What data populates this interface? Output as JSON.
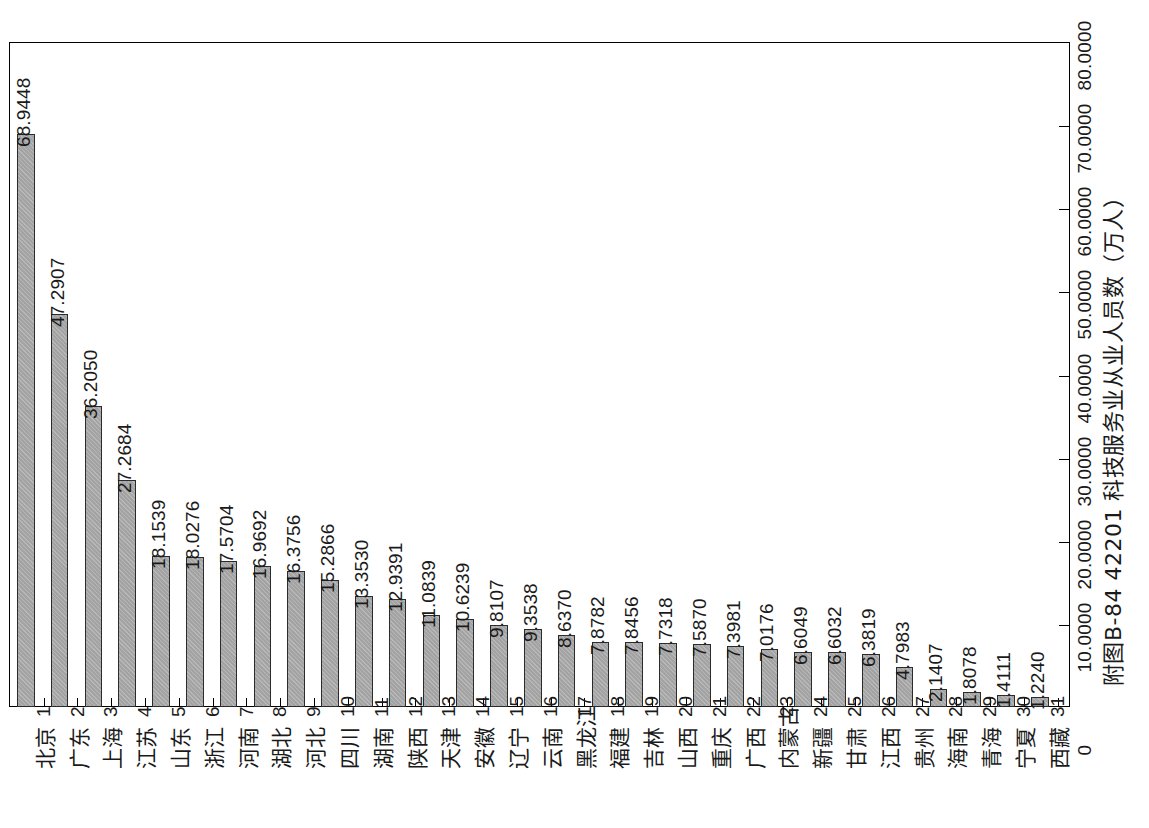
{
  "caption": "附图B-84  42201 科技服务业从业人员数（万人）",
  "chart_data": {
    "type": "bar",
    "title": "附图B-84  42201 科技服务业从业人员数（万人）",
    "xlabel": "",
    "ylabel": "万人",
    "orientation": "vertical-rotated-90ccw",
    "ylim": [
      0,
      80
    ],
    "grid": false,
    "legend": null,
    "value_tick_labels": [
      "0",
      "10.0000",
      "20.0000",
      "30.0000",
      "40.0000",
      "50.0000",
      "60.0000",
      "70.0000",
      "80.0000"
    ],
    "value_ticks": [
      0,
      10,
      20,
      30,
      40,
      50,
      60,
      70,
      80
    ],
    "ranks": [
      1,
      2,
      3,
      4,
      5,
      6,
      7,
      8,
      9,
      10,
      11,
      12,
      13,
      14,
      15,
      16,
      17,
      18,
      19,
      20,
      21,
      22,
      23,
      24,
      25,
      26,
      27,
      28,
      29,
      30,
      31
    ],
    "categories": [
      "北京",
      "广东",
      "上海",
      "江苏",
      "山东",
      "浙江",
      "河南",
      "湖北",
      "河北",
      "四川",
      "湖南",
      "陕西",
      "天津",
      "安徽",
      "辽宁",
      "云南",
      "黑龙江",
      "福建",
      "吉林",
      "山西",
      "重庆",
      "广西",
      "内蒙古",
      "新疆",
      "甘肃",
      "江西",
      "贵州",
      "海南",
      "青海",
      "宁夏",
      "西藏"
    ],
    "values": [
      68.9448,
      47.2907,
      36.205,
      27.2684,
      18.1539,
      18.0276,
      17.5704,
      16.9692,
      16.3756,
      15.2866,
      13.353,
      12.9391,
      11.0839,
      10.6239,
      9.8107,
      9.3538,
      8.637,
      7.8782,
      7.8456,
      7.7318,
      7.587,
      7.3981,
      7.0176,
      6.6049,
      6.6032,
      6.3819,
      4.7983,
      2.1407,
      1.8078,
      1.4111,
      1.224
    ],
    "value_labels": [
      "68.9448",
      "47.2907",
      "36.2050",
      "27.2684",
      "18.1539",
      "18.0276",
      "17.5704",
      "16.9692",
      "16.3756",
      "15.2866",
      "13.3530",
      "12.9391",
      "11.0839",
      "10.6239",
      "9.8107",
      "9.3538",
      "8.6370",
      "7.8782",
      "7.8456",
      "7.7318",
      "7.5870",
      "7.3981",
      "7.0176",
      "6.6049",
      "6.6032",
      "6.3819",
      "4.7983",
      "2.1407",
      "1.8078",
      "1.4111",
      "1.2240"
    ],
    "bar_fill_color": "#a3a3a3",
    "bar_edge_color": "#2b2b2b",
    "frame_color": "#000000"
  }
}
